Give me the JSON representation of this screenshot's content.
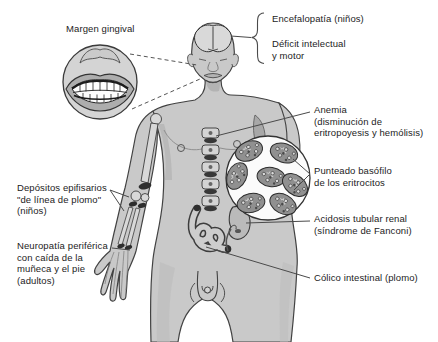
{
  "labels": {
    "margen_gingival": "Margen gingival",
    "encefalopatia": "Encefalopatía (niños)",
    "deficit": "Déficit intelectual\ny motor",
    "anemia": "Anemia\n(disminución de\neritropoyesis y hemólisis)",
    "punteado": "Punteado basófilo\nde los eritrocitos",
    "acidosis": "Acidosis tubular renal\n(síndrome de Fanconi)",
    "colico": "Cólico intestinal (plomo)",
    "depositos": "Depósitos epifisarios\n\"de línea de plomo\"\n(niños)",
    "neuropatia": "Neuropatía periférica\ncon caída de la\nmuñeca y el pie\n(adultos)"
  },
  "colors": {
    "background": "#ffffff",
    "body_fill": "#c9c9c9",
    "body_shade": "#b3b3b3",
    "outline": "#424242",
    "bone_fill": "#d8d8d8",
    "lead_band": "#2e2e2e",
    "cell_fill": "#909090",
    "inset_fill": "#fbfbfb",
    "text": "#1c1c1c",
    "leader_line": "#4a4a4a"
  },
  "icons": {
    "brain": "brain-icon",
    "teeth": "teeth-icon",
    "red_blood_cells": "red-blood-cells-icon",
    "spine": "spine-icon",
    "arm_bones": "arm-bones-icon",
    "intestine": "intestine-icon",
    "kidney": "kidney-icon"
  }
}
